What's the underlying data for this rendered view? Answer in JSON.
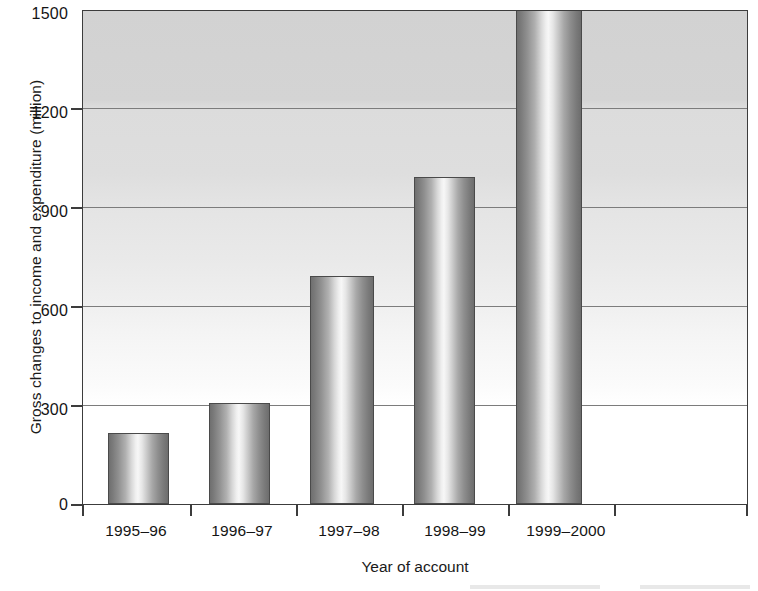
{
  "chart_data": {
    "type": "bar",
    "title": "",
    "xlabel": "Year of account",
    "ylabel": "Gross changes to income and expenditure (million)",
    "categories": [
      "1995–96",
      "1996–97",
      "1997–98",
      "1998–99",
      "1999–2000"
    ],
    "values": [
      215,
      305,
      690,
      990,
      1520
    ],
    "value_labels": [
      "215",
      "305",
      "690",
      "990",
      "1520"
    ],
    "ylim": [
      0,
      1500
    ],
    "yticks": [
      0,
      300,
      600,
      900,
      1200,
      1500
    ],
    "ytick_labels": [
      "0",
      "300",
      "600",
      "900",
      "1200",
      "1500"
    ],
    "grid": "horizontal",
    "legend": "none",
    "bar_style": "cylindrical-gradient-grayscale",
    "colors": {
      "bar_edge": "#6f6f6f",
      "bar_highlight": "#f7f7f7",
      "axis": "#3c3c3c",
      "gridline": "#7c7c7c",
      "plot_background_top": "#d2d2d2",
      "plot_background_bottom": "#ffffff",
      "text": "#141414"
    }
  }
}
